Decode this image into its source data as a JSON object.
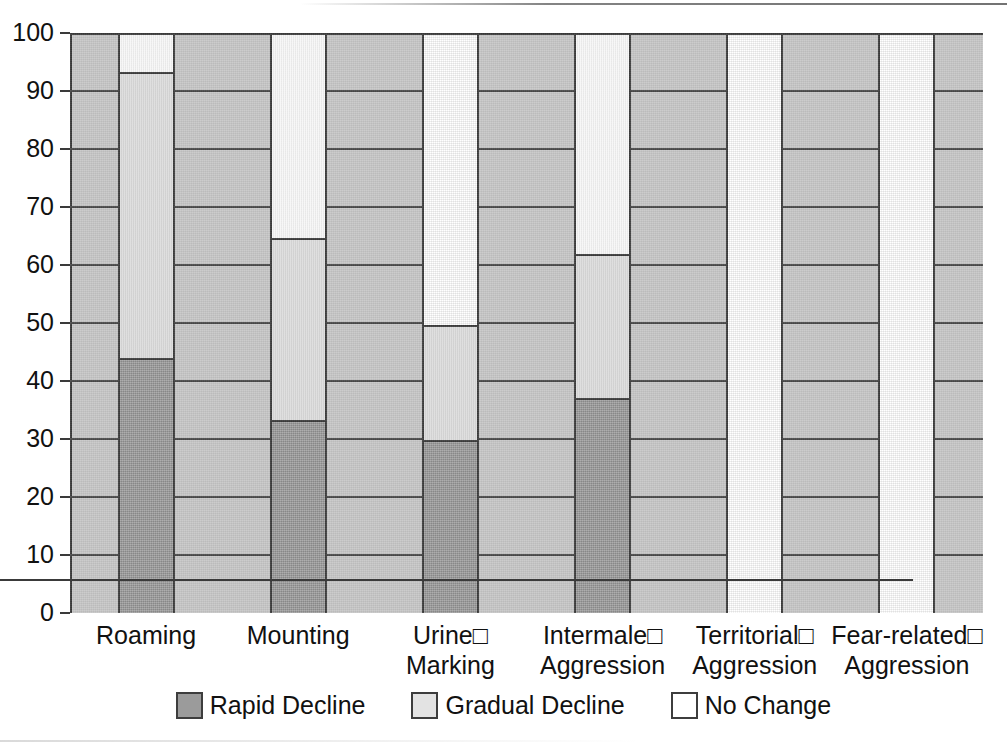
{
  "chart_data": {
    "type": "bar",
    "subtype": "stacked-100-percent",
    "title": "",
    "xlabel": "",
    "ylabel": "",
    "ylim": [
      0,
      100
    ],
    "yticks": [
      0,
      10,
      20,
      30,
      40,
      50,
      60,
      70,
      80,
      90,
      100
    ],
    "grid": true,
    "legend_position": "bottom-center",
    "categories": [
      "Roaming",
      "Mounting",
      "Urine□\nMarking",
      "Intermale□\nAggression",
      "Territorial□\nAggression",
      "Fear-related□\nAggression"
    ],
    "series": [
      {
        "name": "Rapid Decline",
        "color": "#9b9b9b",
        "values": [
          44.0,
          33.3,
          29.8,
          37.1,
          0,
          0
        ]
      },
      {
        "name": "Gradual Decline",
        "color": "#e3e3e3",
        "values": [
          49.3,
          31.4,
          19.9,
          24.8,
          0,
          0
        ]
      },
      {
        "name": "No Change",
        "color": "#ffffff",
        "values": [
          6.7,
          35.3,
          50.3,
          38.1,
          100,
          100
        ]
      }
    ]
  },
  "style": {
    "plot_background": "#c8c8c8",
    "axis_color": "#3a3a3a",
    "gridline_color": "#4a4a4a",
    "bar_outline": "#3d3d3d",
    "text_color": "#111111"
  },
  "legend": {
    "items": [
      {
        "label": "Rapid Decline",
        "swatch": "rapid"
      },
      {
        "label": "Gradual Decline",
        "swatch": "gradual"
      },
      {
        "label": "No Change",
        "swatch": "none"
      }
    ]
  }
}
